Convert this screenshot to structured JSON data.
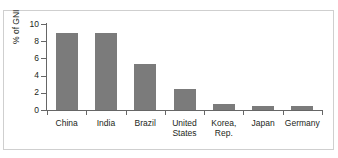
{
  "chart_data": {
    "type": "bar",
    "title": "",
    "xlabel": "",
    "ylabel": "% of GNI",
    "ylim": [
      0,
      10
    ],
    "yticks": [
      0,
      2,
      4,
      6,
      8,
      10
    ],
    "ytick_labels": [
      "0",
      "2",
      "4",
      "6",
      "8",
      "10"
    ],
    "grid": false,
    "legend": "none",
    "bar_color": "#7b7b7b",
    "categories": [
      "China",
      "India",
      "Brazil",
      "United States",
      "Korea, Rep.",
      "Japan",
      "Germany"
    ],
    "category_lines": [
      [
        "China"
      ],
      [
        "India"
      ],
      [
        "Brazil"
      ],
      [
        "United",
        "States"
      ],
      [
        "Korea,",
        "Rep."
      ],
      [
        "Japan"
      ],
      [
        "Germany"
      ]
    ],
    "values": [
      9.0,
      8.9,
      5.4,
      2.5,
      0.7,
      0.5,
      0.45
    ]
  }
}
